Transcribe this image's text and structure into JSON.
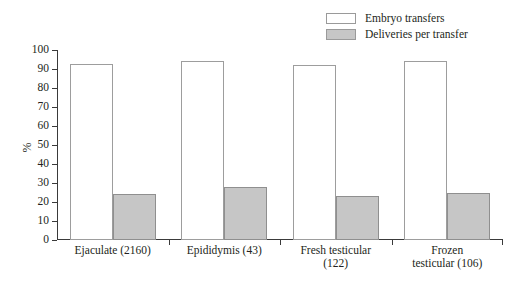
{
  "chart_data": {
    "type": "bar",
    "title": "",
    "subtitle": "",
    "xlabel": "",
    "ylabel": "%",
    "ylim": [
      0,
      100
    ],
    "ytick_step": 10,
    "yticks": [
      0,
      10,
      20,
      30,
      40,
      50,
      60,
      70,
      80,
      90,
      100
    ],
    "grid": false,
    "legend_position": "top-right",
    "categories": [
      "Ejaculate (2160)",
      "Epididymis (43)",
      "Fresh testicular\n(122)",
      "Frozen\ntesticular (106)"
    ],
    "series": [
      {
        "name": "Embryo transfers",
        "color": "#ffffff",
        "values": [
          92.5,
          94,
          92,
          94
        ]
      },
      {
        "name": "Deliveries per transfer",
        "color": "#c6c6c6",
        "values": [
          24,
          28,
          23,
          25
        ]
      }
    ]
  },
  "legend": {
    "items": [
      {
        "label": "Embryo transfers"
      },
      {
        "label": "Deliveries per transfer"
      }
    ]
  },
  "axis": {
    "y_title": "%",
    "y_labels": [
      "100",
      "90",
      "80",
      "70",
      "60",
      "50",
      "40",
      "30",
      "20",
      "10",
      "0"
    ]
  },
  "colors": {
    "embryo_fill": "#ffffff",
    "embryo_border": "#9d9d9d",
    "delivery_fill": "#c6c6c6",
    "delivery_border": "#8f8f8f",
    "axis": "#3a3a3a",
    "text": "#231f20"
  }
}
